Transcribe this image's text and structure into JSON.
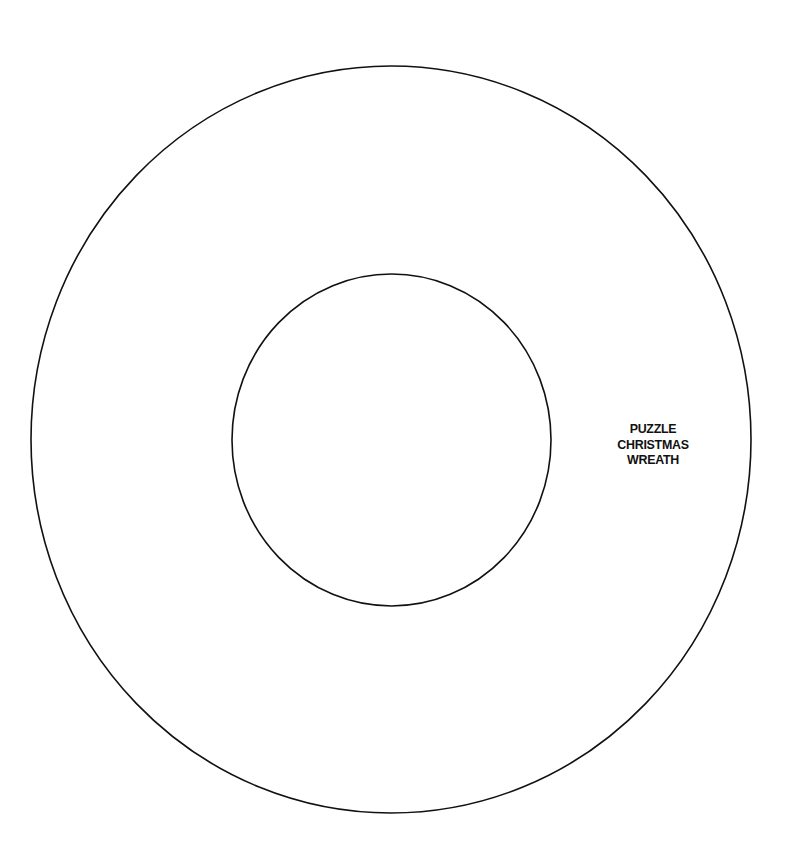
{
  "template": {
    "title_lines": [
      "PUZZLE",
      "CHRISTMAS",
      "WREATH"
    ]
  },
  "shapes": {
    "outer_ring": {
      "cx": 391,
      "cy": 439.5,
      "rx": 360,
      "ry": 373.5,
      "stroke": "#111111"
    },
    "inner_ring": {
      "cx": 391.5,
      "cy": 440,
      "rx": 159.5,
      "ry": 166,
      "stroke": "#111111"
    }
  },
  "colors": {
    "background": "#ffffff",
    "line": "#111111"
  }
}
